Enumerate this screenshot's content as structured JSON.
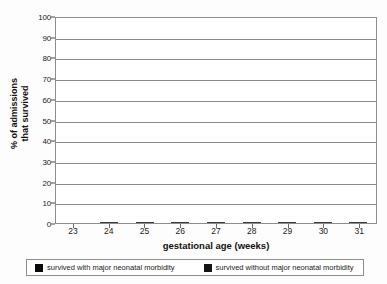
{
  "chart_data": {
    "type": "bar",
    "subtype": "stacked-bar",
    "title": "",
    "xlabel": "gestational age (weeks)",
    "ylabel": "% of admissions that survived",
    "ylabel_line1": "% of admissions",
    "ylabel_line2": "that survived",
    "categories": [
      "23",
      "24",
      "25",
      "26",
      "27",
      "28",
      "29",
      "30",
      "31"
    ],
    "ylim": [
      0,
      100
    ],
    "ytick_step": 10,
    "yticks": [
      "0",
      "10",
      "20",
      "30",
      "40",
      "50",
      "60",
      "70",
      "80",
      "90",
      "100"
    ],
    "grid": "horizontal",
    "legend_position": "bottom",
    "series": [
      {
        "name": "survived with major neonatal morbidity",
        "color": "#0a0a0a",
        "stack_position": "top",
        "values": [
          43,
          43,
          54,
          45,
          39,
          14,
          18.5,
          8.5,
          4.5
        ]
      },
      {
        "name": "survived without major neonatal morbidity",
        "color": "#151515",
        "stack_position": "bottom",
        "values": [
          0,
          8,
          21,
          41,
          51,
          79,
          79,
          90,
          94
        ]
      }
    ],
    "totals": [
      43,
      51,
      75,
      86,
      90,
      93,
      97.5,
      98.5,
      98.5
    ]
  },
  "legend": {
    "items": [
      {
        "label": "survived with major neonatal morbidity",
        "swatch_color": "#0a0a0a"
      },
      {
        "label": "survived without major neonatal morbidity",
        "swatch_color": "#151515"
      }
    ]
  }
}
